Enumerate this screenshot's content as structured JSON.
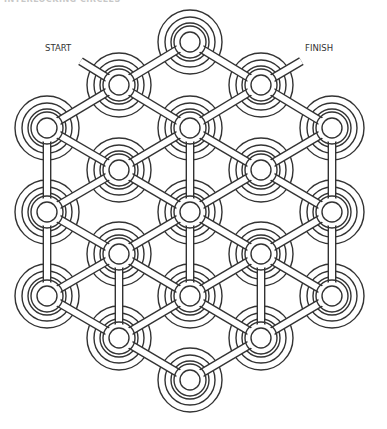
{
  "puzzle": {
    "title": "INTERLOCKING CIRCLES",
    "start_label": "START",
    "finish_label": "FINISH",
    "type": "maze",
    "node_count": 19,
    "line_color": "#333333",
    "background_color": "#ffffff"
  }
}
